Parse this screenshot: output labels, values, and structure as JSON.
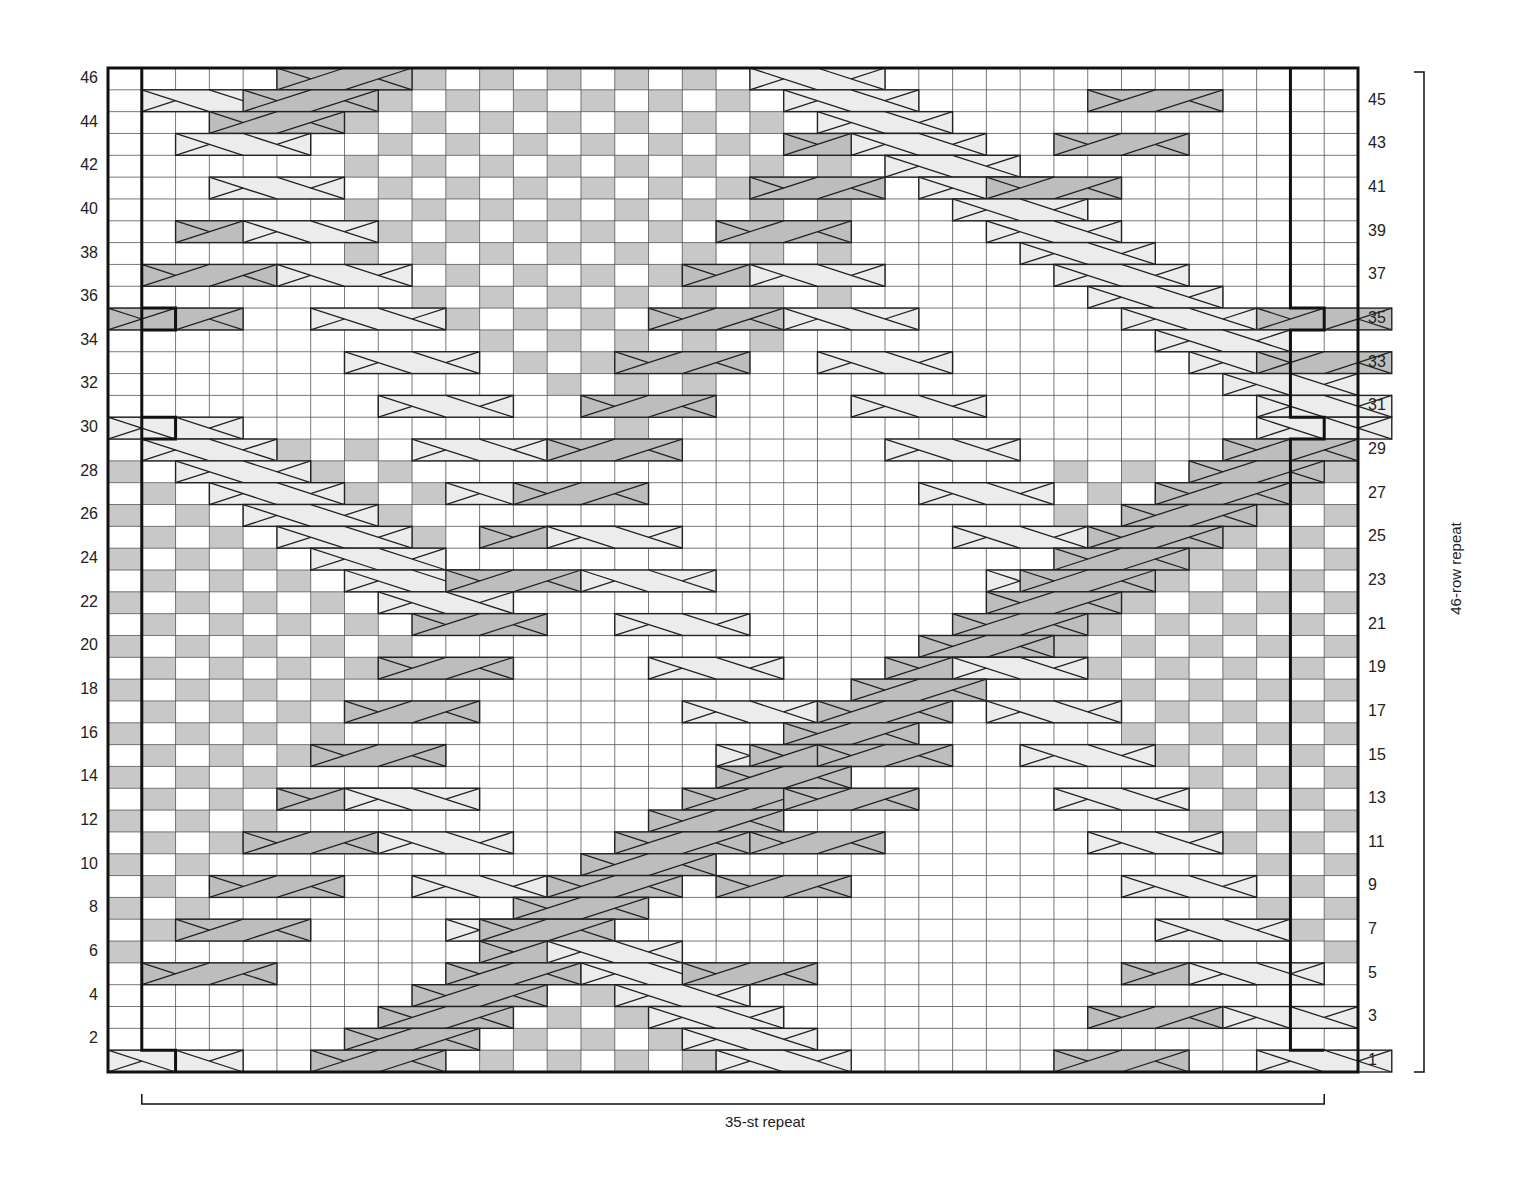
{
  "chart": {
    "columns": 37,
    "rows": 46,
    "geometry": {
      "left": 108,
      "top": 68,
      "right": 1358,
      "bottom": 1072
    },
    "colors": {
      "background": "#ffffff",
      "grid_line": "#555555",
      "border": "#111111",
      "shaded": "#c8c8c8",
      "cable_light": "#ececec",
      "cable_dark": "#bdbdbd",
      "cable_stroke": "#222222"
    },
    "left_row_labels": [
      "2",
      "4",
      "6",
      "8",
      "10",
      "12",
      "14",
      "16",
      "18",
      "20",
      "22",
      "24",
      "26",
      "28",
      "30",
      "32",
      "34",
      "36",
      "38",
      "40",
      "42",
      "44",
      "46"
    ],
    "right_row_labels": [
      "1",
      "3",
      "5",
      "7",
      "9",
      "11",
      "13",
      "15",
      "17",
      "19",
      "21",
      "23",
      "25",
      "27",
      "29",
      "31",
      "33",
      "35",
      "37",
      "39",
      "41",
      "43",
      "45"
    ],
    "bottom_repeat_label": "35-st repeat",
    "side_repeat_label": "46-row repeat",
    "repeat_columns": [
      2,
      36
    ]
  },
  "shaded_regions": {
    "top_seed": {
      "rows": [
        30,
        46
      ],
      "center_col": 13,
      "description": "seed stitch diamond upper-center"
    },
    "left_seed": {
      "rows": [
        5,
        29
      ],
      "description": "seed stitch triangle left side"
    },
    "right_seed": {
      "rows": [
        5,
        29
      ],
      "description": "seed stitch triangle right side"
    },
    "bottom_seed": {
      "rows": [
        1,
        4
      ],
      "description": "seed stitch triangle bottom-center"
    }
  },
  "cables": [
    {
      "row": 46,
      "col": 6,
      "type": "dark"
    },
    {
      "row": 46,
      "col": 20,
      "type": "light"
    },
    {
      "row": 45,
      "col": 2,
      "type": "light"
    },
    {
      "row": 45,
      "col": 5,
      "type": "dark"
    },
    {
      "row": 45,
      "col": 21,
      "type": "light"
    },
    {
      "row": 45,
      "col": 30,
      "type": "dark"
    },
    {
      "row": 44,
      "col": 4,
      "type": "dark"
    },
    {
      "row": 44,
      "col": 22,
      "type": "light"
    },
    {
      "row": 43,
      "col": 3,
      "type": "light"
    },
    {
      "row": 43,
      "col": 21,
      "type": "dark"
    },
    {
      "row": 43,
      "col": 23,
      "type": "light"
    },
    {
      "row": 43,
      "col": 29,
      "type": "dark"
    },
    {
      "row": 42,
      "col": 24,
      "type": "light"
    },
    {
      "row": 41,
      "col": 4,
      "type": "light"
    },
    {
      "row": 41,
      "col": 20,
      "type": "dark"
    },
    {
      "row": 41,
      "col": 25,
      "type": "light"
    },
    {
      "row": 41,
      "col": 27,
      "type": "dark"
    },
    {
      "row": 40,
      "col": 26,
      "type": "light"
    },
    {
      "row": 39,
      "col": 3,
      "type": "dark"
    },
    {
      "row": 39,
      "col": 5,
      "type": "light"
    },
    {
      "row": 39,
      "col": 19,
      "type": "dark"
    },
    {
      "row": 39,
      "col": 27,
      "type": "light"
    },
    {
      "row": 38,
      "col": 28,
      "type": "light"
    },
    {
      "row": 37,
      "col": 2,
      "type": "dark"
    },
    {
      "row": 37,
      "col": 6,
      "type": "light"
    },
    {
      "row": 37,
      "col": 18,
      "type": "dark"
    },
    {
      "row": 37,
      "col": 20,
      "type": "light"
    },
    {
      "row": 37,
      "col": 29,
      "type": "light"
    },
    {
      "row": 36,
      "col": 30,
      "type": "light"
    },
    {
      "row": 35,
      "col": 1,
      "type": "dark"
    },
    {
      "row": 35,
      "col": 7,
      "type": "light"
    },
    {
      "row": 35,
      "col": 17,
      "type": "dark"
    },
    {
      "row": 35,
      "col": 21,
      "type": "light"
    },
    {
      "row": 35,
      "col": 31,
      "type": "light"
    },
    {
      "row": 35,
      "col": 35,
      "type": "dark"
    },
    {
      "row": 34,
      "col": 32,
      "type": "light"
    },
    {
      "row": 33,
      "col": 8,
      "type": "light"
    },
    {
      "row": 33,
      "col": 16,
      "type": "dark"
    },
    {
      "row": 33,
      "col": 22,
      "type": "light"
    },
    {
      "row": 33,
      "col": 33,
      "type": "light"
    },
    {
      "row": 33,
      "col": 35,
      "type": "dark"
    },
    {
      "row": 32,
      "col": 34,
      "type": "light"
    },
    {
      "row": 31,
      "col": 9,
      "type": "light"
    },
    {
      "row": 31,
      "col": 15,
      "type": "dark"
    },
    {
      "row": 31,
      "col": 23,
      "type": "light"
    },
    {
      "row": 31,
      "col": 35,
      "type": "light"
    },
    {
      "row": 30,
      "col": 1,
      "type": "light"
    },
    {
      "row": 30,
      "col": 35,
      "type": "light"
    },
    {
      "row": 29,
      "col": 2,
      "type": "light"
    },
    {
      "row": 29,
      "col": 10,
      "type": "light"
    },
    {
      "row": 29,
      "col": 14,
      "type": "dark"
    },
    {
      "row": 29,
      "col": 24,
      "type": "light"
    },
    {
      "row": 29,
      "col": 34,
      "type": "dark"
    },
    {
      "row": 28,
      "col": 3,
      "type": "light"
    },
    {
      "row": 28,
      "col": 33,
      "type": "dark"
    },
    {
      "row": 27,
      "col": 4,
      "type": "light"
    },
    {
      "row": 27,
      "col": 11,
      "type": "light"
    },
    {
      "row": 27,
      "col": 13,
      "type": "dark"
    },
    {
      "row": 27,
      "col": 25,
      "type": "light"
    },
    {
      "row": 27,
      "col": 32,
      "type": "dark"
    },
    {
      "row": 26,
      "col": 5,
      "type": "light"
    },
    {
      "row": 26,
      "col": 31,
      "type": "dark"
    },
    {
      "row": 25,
      "col": 6,
      "type": "light"
    },
    {
      "row": 25,
      "col": 12,
      "type": "dark"
    },
    {
      "row": 25,
      "col": 14,
      "type": "light"
    },
    {
      "row": 25,
      "col": 26,
      "type": "light"
    },
    {
      "row": 25,
      "col": 30,
      "type": "dark"
    },
    {
      "row": 24,
      "col": 7,
      "type": "light"
    },
    {
      "row": 24,
      "col": 29,
      "type": "dark"
    },
    {
      "row": 23,
      "col": 8,
      "type": "light"
    },
    {
      "row": 23,
      "col": 11,
      "type": "dark"
    },
    {
      "row": 23,
      "col": 15,
      "type": "light"
    },
    {
      "row": 23,
      "col": 27,
      "type": "light"
    },
    {
      "row": 23,
      "col": 28,
      "type": "dark"
    },
    {
      "row": 22,
      "col": 9,
      "type": "light"
    },
    {
      "row": 22,
      "col": 27,
      "type": "dark"
    },
    {
      "row": 21,
      "col": 10,
      "type": "dark"
    },
    {
      "row": 21,
      "col": 16,
      "type": "light"
    },
    {
      "row": 21,
      "col": 26,
      "type": "dark"
    },
    {
      "row": 20,
      "col": 25,
      "type": "dark"
    },
    {
      "row": 19,
      "col": 9,
      "type": "dark"
    },
    {
      "row": 19,
      "col": 17,
      "type": "light"
    },
    {
      "row": 19,
      "col": 24,
      "type": "dark"
    },
    {
      "row": 19,
      "col": 26,
      "type": "light"
    },
    {
      "row": 18,
      "col": 23,
      "type": "dark"
    },
    {
      "row": 17,
      "col": 8,
      "type": "dark"
    },
    {
      "row": 17,
      "col": 18,
      "type": "light"
    },
    {
      "row": 17,
      "col": 22,
      "type": "dark"
    },
    {
      "row": 17,
      "col": 27,
      "type": "light"
    },
    {
      "row": 16,
      "col": 21,
      "type": "dark"
    },
    {
      "row": 15,
      "col": 7,
      "type": "dark"
    },
    {
      "row": 15,
      "col": 19,
      "type": "light"
    },
    {
      "row": 15,
      "col": 20,
      "type": "dark"
    },
    {
      "row": 15,
      "col": 22,
      "type": "dark"
    },
    {
      "row": 15,
      "col": 28,
      "type": "light"
    },
    {
      "row": 14,
      "col": 19,
      "type": "dark"
    },
    {
      "row": 13,
      "col": 6,
      "type": "dark"
    },
    {
      "row": 13,
      "col": 8,
      "type": "light"
    },
    {
      "row": 13,
      "col": 18,
      "type": "dark"
    },
    {
      "row": 13,
      "col": 21,
      "type": "dark"
    },
    {
      "row": 13,
      "col": 29,
      "type": "light"
    },
    {
      "row": 12,
      "col": 17,
      "type": "dark"
    },
    {
      "row": 11,
      "col": 5,
      "type": "dark"
    },
    {
      "row": 11,
      "col": 9,
      "type": "light"
    },
    {
      "row": 11,
      "col": 16,
      "type": "dark"
    },
    {
      "row": 11,
      "col": 20,
      "type": "dark"
    },
    {
      "row": 11,
      "col": 30,
      "type": "light"
    },
    {
      "row": 10,
      "col": 15,
      "type": "dark"
    },
    {
      "row": 9,
      "col": 4,
      "type": "dark"
    },
    {
      "row": 9,
      "col": 10,
      "type": "light"
    },
    {
      "row": 9,
      "col": 14,
      "type": "dark"
    },
    {
      "row": 9,
      "col": 19,
      "type": "dark"
    },
    {
      "row": 9,
      "col": 31,
      "type": "light"
    },
    {
      "row": 8,
      "col": 13,
      "type": "dark"
    },
    {
      "row": 7,
      "col": 3,
      "type": "dark"
    },
    {
      "row": 7,
      "col": 11,
      "type": "light"
    },
    {
      "row": 7,
      "col": 12,
      "type": "dark"
    },
    {
      "row": 7,
      "col": 32,
      "type": "light"
    },
    {
      "row": 6,
      "col": 12,
      "type": "dark"
    },
    {
      "row": 6,
      "col": 14,
      "type": "light"
    },
    {
      "row": 5,
      "col": 2,
      "type": "dark"
    },
    {
      "row": 5,
      "col": 11,
      "type": "dark"
    },
    {
      "row": 5,
      "col": 15,
      "type": "light"
    },
    {
      "row": 5,
      "col": 18,
      "type": "dark"
    },
    {
      "row": 5,
      "col": 31,
      "type": "dark"
    },
    {
      "row": 5,
      "col": 33,
      "type": "light"
    },
    {
      "row": 4,
      "col": 10,
      "type": "dark"
    },
    {
      "row": 4,
      "col": 16,
      "type": "light"
    },
    {
      "row": 3,
      "col": 9,
      "type": "dark"
    },
    {
      "row": 3,
      "col": 17,
      "type": "light"
    },
    {
      "row": 3,
      "col": 30,
      "type": "dark"
    },
    {
      "row": 3,
      "col": 34,
      "type": "light"
    },
    {
      "row": 2,
      "col": 8,
      "type": "dark"
    },
    {
      "row": 2,
      "col": 18,
      "type": "light"
    },
    {
      "row": 1,
      "col": 1,
      "type": "light"
    },
    {
      "row": 1,
      "col": 7,
      "type": "dark"
    },
    {
      "row": 1,
      "col": 19,
      "type": "light"
    },
    {
      "row": 1,
      "col": 29,
      "type": "dark"
    },
    {
      "row": 1,
      "col": 35,
      "type": "light"
    }
  ]
}
